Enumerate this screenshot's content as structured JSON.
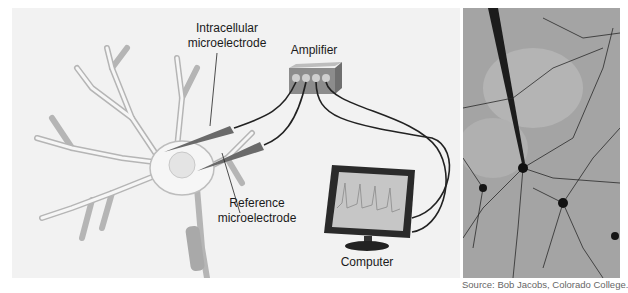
{
  "figure": {
    "labels": {
      "intracellular_line1": "Intracellular",
      "intracellular_line2": "microelectrode",
      "amplifier": "Amplifier",
      "reference_line1": "Reference",
      "reference_line2": "microelectrode",
      "computer": "Computer"
    },
    "caption_source": "Source: Bob Jacobs, Colorado College.",
    "colors": {
      "background_panel": "#f2f2f2",
      "neuron_fill": "#f5f5f5",
      "neuron_outline": "#b8b8b8",
      "electrode": "#6a6a6a",
      "wire": "#222222",
      "photo_bg": "#a8a8a8"
    }
  }
}
